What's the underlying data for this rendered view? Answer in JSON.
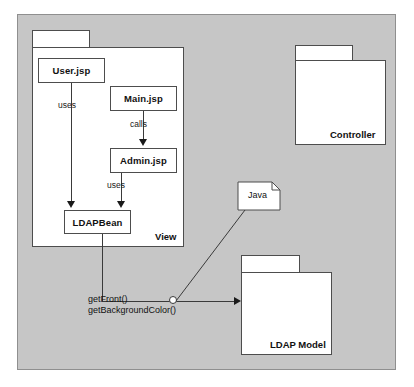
{
  "diagram": {
    "background_color": "#c6c6c6",
    "box_fill": "#ffffff",
    "line_color": "#3a3a3a"
  },
  "packages": [
    {
      "id": "view",
      "label": "View"
    },
    {
      "id": "controller",
      "label": "Controller"
    },
    {
      "id": "ldap_model",
      "label": "LDAP Model"
    }
  ],
  "classes": [
    {
      "id": "user_jsp",
      "label": "User.jsp"
    },
    {
      "id": "main_jsp",
      "label": "Main.jsp"
    },
    {
      "id": "admin_jsp",
      "label": "Admin.jsp"
    },
    {
      "id": "ldap_bean",
      "label": "LDAPBean"
    }
  ],
  "notes": [
    {
      "id": "java_note",
      "label": "Java"
    }
  ],
  "edges": [
    {
      "id": "user-to-ldapbean",
      "label": "uses",
      "from": "user_jsp",
      "to": "ldap_bean"
    },
    {
      "id": "main-to-admin",
      "label": "calls",
      "from": "main_jsp",
      "to": "admin_jsp"
    },
    {
      "id": "admin-to-ldapbean",
      "label": "uses",
      "from": "admin_jsp",
      "to": "ldap_bean"
    },
    {
      "id": "ldapbean-to-model",
      "label": "",
      "from": "ldap_bean",
      "to": "ldap_model"
    },
    {
      "id": "java-note-anchor",
      "label": "",
      "from": "java_note",
      "to": "interface-socket"
    }
  ],
  "operations": {
    "line1": "getFront()",
    "line2": "getBackgroundColor()"
  }
}
